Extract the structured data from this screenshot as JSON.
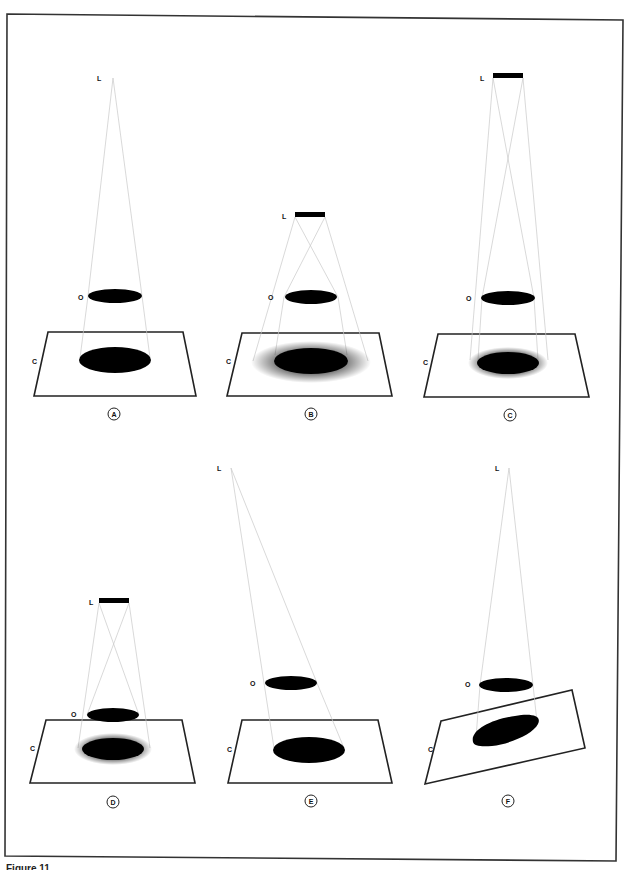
{
  "figure": {
    "caption_partial": "Figure 11",
    "panels": [
      {
        "id": "A",
        "label": "A",
        "light_label": "L",
        "object_label": "O",
        "surface_label": "C",
        "light_type": "point",
        "surface": "horizontal",
        "shadow": "sharp"
      },
      {
        "id": "B",
        "label": "B",
        "light_label": "L",
        "object_label": "O",
        "surface_label": "C",
        "light_type": "extended-near",
        "surface": "horizontal",
        "shadow": "umbra with wide penumbra"
      },
      {
        "id": "C",
        "label": "C",
        "light_label": "L",
        "object_label": "O",
        "surface_label": "C",
        "light_type": "extended-far",
        "surface": "horizontal",
        "shadow": "umbra with narrow penumbra"
      },
      {
        "id": "D",
        "label": "D",
        "light_label": "L",
        "object_label": "O",
        "surface_label": "C",
        "light_type": "extended",
        "surface": "horizontal-close",
        "shadow": "umbra with narrow penumbra"
      },
      {
        "id": "E",
        "label": "E",
        "light_label": "L",
        "object_label": "O",
        "surface_label": "C",
        "light_type": "point-oblique",
        "surface": "horizontal",
        "shadow": "displaced sharp"
      },
      {
        "id": "F",
        "label": "F",
        "light_label": "L",
        "object_label": "O",
        "surface_label": "C",
        "light_type": "point",
        "surface": "tilted",
        "shadow": "distorted sharp"
      }
    ]
  },
  "colors": {
    "ink": "#111111",
    "rays": "#c8c8c8",
    "background": "#ffffff"
  }
}
